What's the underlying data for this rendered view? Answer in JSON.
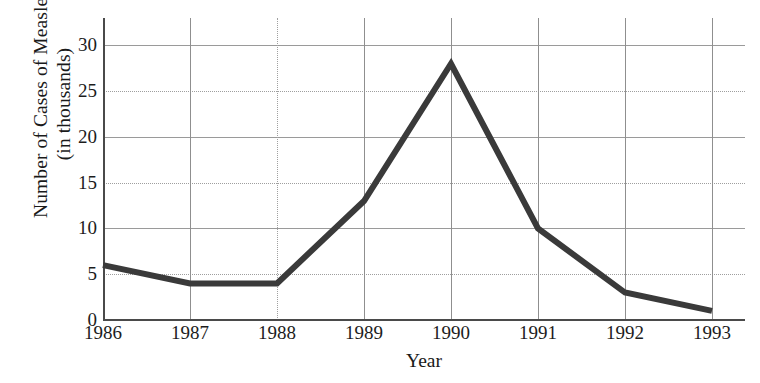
{
  "chart_data": {
    "type": "line",
    "title": "",
    "xlabel": "Year",
    "ylabel_lines": [
      "Number of Cases of Measles",
      "(in thousands)"
    ],
    "ylabel": "Number of Cases of Measles (in thousands)",
    "categories": [
      "1986",
      "1987",
      "1988",
      "1989",
      "1990",
      "1991",
      "1992",
      "1993"
    ],
    "values": [
      6,
      4,
      4,
      13,
      28,
      10,
      3,
      1
    ],
    "x": [
      1986,
      1987,
      1988,
      1989,
      1990,
      1991,
      1992,
      1993
    ],
    "xlim": [
      1986,
      1993
    ],
    "ylim": [
      0,
      33
    ],
    "ytick_labels": [
      "0",
      "5",
      "10",
      "15",
      "20",
      "25",
      "30"
    ],
    "ytick_values": [
      0,
      5,
      10,
      15,
      20,
      25,
      30
    ],
    "xtick_labels": [
      "1986",
      "1987",
      "1988",
      "1989",
      "1990",
      "1991",
      "1992",
      "1993"
    ],
    "grid": true,
    "grid_color": "#9a9a9a",
    "legend": null,
    "legend_position": "none",
    "series": [
      {
        "name": "Number of Cases of Measles (in thousands)",
        "values": [
          6,
          4,
          4,
          13,
          28,
          10,
          3,
          1
        ],
        "color": "#3a3a3a",
        "line_width": 6
      }
    ],
    "annotations": [],
    "points": [
      {
        "year": "1986",
        "value": 6
      },
      {
        "year": "1987",
        "value": 4
      },
      {
        "year": "1988",
        "value": 4
      },
      {
        "year": "1989",
        "value": 13
      },
      {
        "year": "1990",
        "value": 28
      },
      {
        "year": "1991",
        "value": 10
      },
      {
        "year": "1992",
        "value": 3
      },
      {
        "year": "1993",
        "value": 1
      }
    ]
  },
  "colors": {
    "line": "#3a3a3a",
    "axis": "#4a4a4a",
    "grid": "#9a9a9a",
    "text": "#1a1a1a",
    "background": "#ffffff"
  }
}
